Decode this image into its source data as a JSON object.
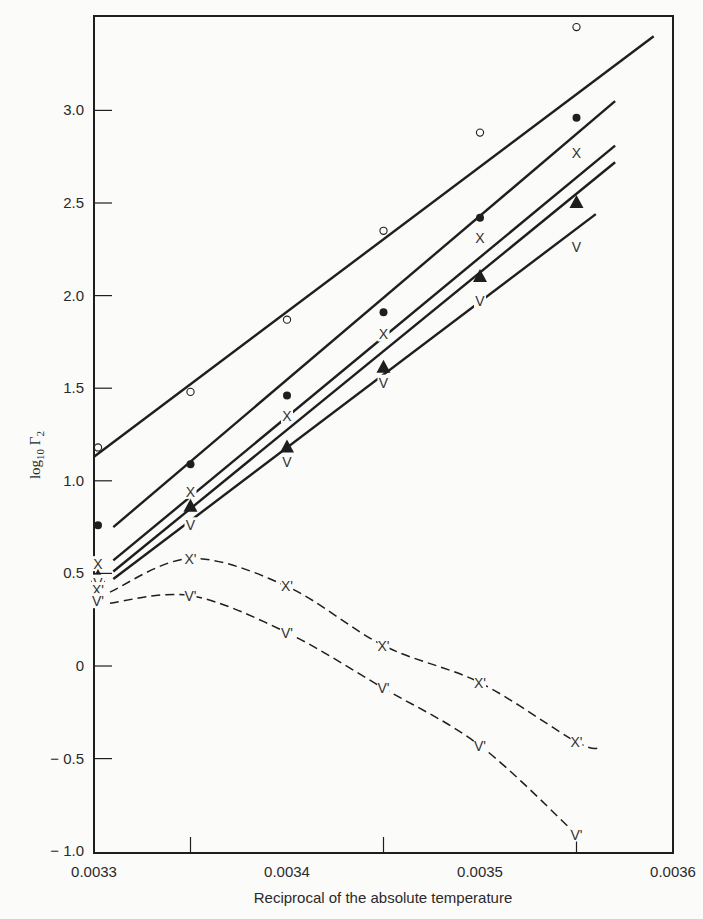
{
  "chart_data": {
    "type": "scatter",
    "title": "",
    "xlabel": "Reciprocal of the absolute temperature",
    "ylabel": "log10 Γ2",
    "ylabel_parts": {
      "base": "log",
      "sub": "10",
      "sym": "Γ",
      "sub2": "2"
    },
    "xlim": [
      0.0033,
      0.0036
    ],
    "ylim": [
      -1.0,
      3.5
    ],
    "grid": false,
    "legend": "none (series identified by marker symbols)",
    "x_ticks": [
      0.0033,
      0.0034,
      0.0035,
      0.0036
    ],
    "x_tick_labels": [
      "0.0033",
      "0.0034",
      "0.0035",
      "0.0036"
    ],
    "x_minor_ticks": [
      0.00335,
      0.00345,
      0.00355
    ],
    "y_ticks": [
      -1.0,
      -0.5,
      0,
      0.5,
      1.0,
      1.5,
      2.0,
      2.5,
      3.0
    ],
    "y_tick_labels": [
      "− 1.0",
      "− 0.5",
      "0",
      "0.5",
      "1.0",
      "1.5",
      "2.0",
      "2.5",
      "3.0"
    ],
    "x": [
      0.0033,
      0.00335,
      0.0034,
      0.00345,
      0.0035,
      0.00355
    ],
    "series": [
      {
        "name": "open circle",
        "marker": "open-circle",
        "values": [
          1.18,
          1.48,
          1.87,
          2.35,
          2.88,
          3.45
        ],
        "fit": {
          "style": "solid",
          "x": [
            0.0033,
            0.00359
          ],
          "y": [
            1.13,
            3.4
          ]
        }
      },
      {
        "name": "filled circle",
        "marker": "filled-circle",
        "values": [
          0.76,
          1.09,
          1.46,
          1.91,
          2.42,
          2.96
        ],
        "fit": {
          "style": "solid",
          "x": [
            0.00331,
            0.00357
          ],
          "y": [
            0.75,
            3.05
          ]
        }
      },
      {
        "name": "X",
        "marker": "X",
        "values": [
          0.55,
          0.94,
          1.35,
          1.79,
          2.31,
          2.77
        ],
        "fit": {
          "style": "solid",
          "x": [
            0.00331,
            0.00357
          ],
          "y": [
            0.57,
            2.81
          ]
        }
      },
      {
        "name": "filled triangle",
        "marker": "filled-triangle",
        "values": [
          0.48,
          0.86,
          1.18,
          1.61,
          2.1,
          2.5
        ],
        "fit": {
          "style": "solid",
          "x": [
            0.00331,
            0.00357
          ],
          "y": [
            0.51,
            2.72
          ]
        }
      },
      {
        "name": "V",
        "marker": "V",
        "values": [
          0.45,
          0.76,
          1.1,
          1.53,
          1.97,
          2.26
        ],
        "fit": {
          "style": "solid",
          "x": [
            0.00331,
            0.00356
          ],
          "y": [
            0.47,
            2.44
          ]
        }
      },
      {
        "name": "X'",
        "marker": "X'",
        "values": [
          0.41,
          0.58,
          0.43,
          0.11,
          -0.09,
          -0.41
        ],
        "fit": {
          "style": "dashed"
        }
      },
      {
        "name": "V'",
        "marker": "V'",
        "values": [
          0.35,
          0.38,
          0.18,
          -0.12,
          -0.43,
          -0.91
        ],
        "fit": {
          "style": "dashed"
        }
      }
    ]
  },
  "labels": {
    "xlabel": "Reciprocal of the absolute temperature",
    "ylabel_base": "log",
    "ylabel_sub": "10",
    "ylabel_sym": " Γ",
    "ylabel_sub2": "2"
  }
}
